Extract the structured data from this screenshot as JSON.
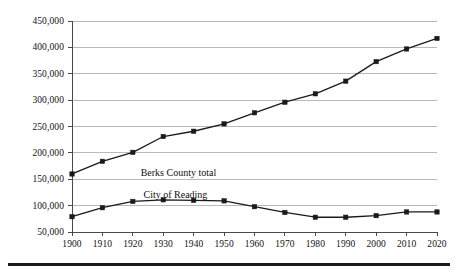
{
  "chart_data": {
    "type": "line",
    "title": "",
    "subtitle": "",
    "xlabel": "",
    "ylabel": "",
    "categories": [
      1900,
      1910,
      1920,
      1930,
      1940,
      1950,
      1960,
      1970,
      1980,
      1990,
      2000,
      2010,
      2020
    ],
    "x_tick_labels": [
      "1900",
      "1910",
      "1920",
      "1930",
      "1940",
      "1950",
      "1960",
      "1970",
      "1980",
      "1990",
      "2000",
      "2010",
      "2020"
    ],
    "y_tick_labels": [
      "50,000",
      "100,000",
      "150,000",
      "200,000",
      "250,000",
      "300,000",
      "350,000",
      "400,000",
      "450,000"
    ],
    "y_tick_values": [
      50000,
      100000,
      150000,
      200000,
      250000,
      300000,
      350000,
      400000,
      450000
    ],
    "xlim": [
      1900,
      2020
    ],
    "ylim": [
      50000,
      450000
    ],
    "grid": "horizontal",
    "legend_position": "inline-annotation",
    "series": [
      {
        "name": "Berks County total",
        "annotation": "Berks County total",
        "annotation_x": 1935,
        "annotation_y": 163000,
        "color": "#1a1a1a",
        "marker": "square",
        "values": [
          160000,
          184000,
          201000,
          231000,
          241000,
          255000,
          276000,
          296000,
          312000,
          336000,
          373000,
          397000,
          417000
        ]
      },
      {
        "name": "City of Reading",
        "annotation": "City of Reading",
        "annotation_x": 1934,
        "annotation_y": 122000,
        "color": "#1a1a1a",
        "marker": "square",
        "values": [
          79000,
          96000,
          108000,
          111000,
          110000,
          109000,
          98000,
          87000,
          78000,
          78000,
          81000,
          88000,
          88000
        ]
      }
    ],
    "colors": {
      "line": "#1a1a1a",
      "gridline": "#b9b9b9",
      "axis": "#4a4a4a",
      "text": "#111111",
      "background": "#ffffff",
      "bottom_rule": "#1b1b1b"
    }
  }
}
